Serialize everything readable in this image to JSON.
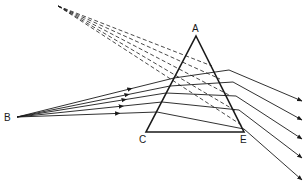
{
  "diagram": {
    "labels": {
      "A": "A",
      "B": "B",
      "C": "C",
      "E": "E"
    },
    "colors": {
      "ink": "#1a1a1a",
      "background": "#ffffff"
    },
    "points": {
      "A": [
        196,
        36
      ],
      "C": [
        146,
        132
      ],
      "E": [
        244,
        132
      ],
      "B": [
        17,
        117
      ]
    },
    "incident_rays": [
      {
        "entry": [
          174,
          78
        ],
        "exit": [
          229,
          70
        ],
        "end": [
          302,
          101
        ]
      },
      {
        "entry": [
          170,
          86
        ],
        "exit": [
          233,
          82
        ],
        "end": [
          302,
          120
        ]
      },
      {
        "entry": [
          166,
          93
        ],
        "exit": [
          236,
          96
        ],
        "end": [
          302,
          139
        ]
      },
      {
        "entry": [
          162,
          102
        ],
        "exit": [
          239,
          110
        ],
        "end": [
          302,
          158
        ]
      },
      {
        "entry": [
          157,
          112
        ],
        "exit": [
          244,
          129
        ],
        "end": [
          302,
          180
        ]
      }
    ],
    "virtual_rays": [
      {
        "start": [
          58,
          6
        ],
        "end": [
          212,
          66
        ]
      },
      {
        "start": [
          58,
          6
        ],
        "end": [
          220,
          79
        ]
      },
      {
        "start": [
          58,
          6
        ],
        "end": [
          229,
          95
        ]
      },
      {
        "start": [
          58,
          6
        ],
        "end": [
          236,
          111
        ]
      },
      {
        "start": [
          58,
          6
        ],
        "end": [
          243,
          126
        ]
      }
    ]
  }
}
